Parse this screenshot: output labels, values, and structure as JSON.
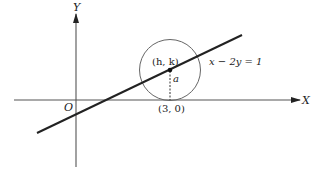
{
  "diagram": {
    "axes": {
      "x_label": "X",
      "y_label": "Y",
      "origin_label": "O"
    },
    "line": {
      "equation_label": "x − 2y = 1"
    },
    "circle": {
      "center_label": "(h, k)",
      "radius_label": "a",
      "tangent_point_label": "(3, 0)"
    },
    "colors": {
      "stroke": "#222222",
      "axis": "#555555",
      "circle": "#666666",
      "background": "#ffffff"
    }
  }
}
